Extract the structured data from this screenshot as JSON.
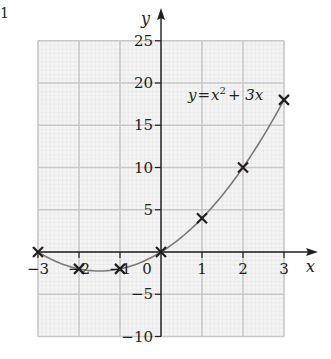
{
  "corner_mark": "1",
  "chart_data": {
    "type": "line",
    "title": "",
    "equation_label": "y = x² + 3x",
    "equation_parts": {
      "y": "y",
      "eq": "=",
      "x": "x",
      "sup": "2",
      "rest": "+ 3x"
    },
    "xlabel": "x",
    "ylabel": "y",
    "xlim": [
      -3,
      3
    ],
    "ylim": [
      -10,
      25
    ],
    "x_ticks": [
      -3,
      -2,
      -1,
      0,
      1,
      2,
      3
    ],
    "x_tick_labels": [
      "−3",
      "−2",
      "−1",
      "0",
      "1",
      "2",
      "3"
    ],
    "y_ticks": [
      -10,
      -5,
      5,
      10,
      15,
      20,
      25
    ],
    "y_tick_labels": [
      "−10",
      "−5",
      "5",
      "10",
      "15",
      "20",
      "25"
    ],
    "grid": true,
    "series": [
      {
        "name": "y = x^2 + 3x",
        "marker": "x",
        "x": [
          -3,
          -2,
          -1,
          0,
          1,
          2,
          3
        ],
        "y": [
          0,
          -2,
          -2,
          0,
          4,
          10,
          18
        ]
      }
    ],
    "colors": {
      "curve": "#7a7a7a",
      "markers": "#231f20",
      "axes": "#231f20",
      "grid_major": "#c8c8c8",
      "grid_minor": "#e6e6e6",
      "grid_bg": "#f4f4f4"
    }
  }
}
